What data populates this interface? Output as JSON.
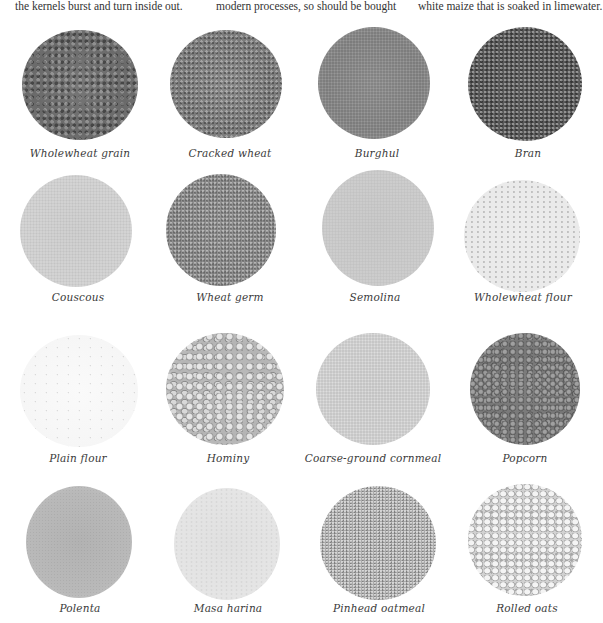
{
  "top_text": {
    "col1": "the kernels burst and turn inside out.",
    "col2": "modern processes, so should be bought",
    "col3": "white maize that is soaked in limewater."
  },
  "grains": [
    {
      "label": "Wholewheat grain",
      "texture": "coarse-dark"
    },
    {
      "label": "Cracked wheat",
      "texture": "coarse-mid"
    },
    {
      "label": "Burghul",
      "texture": "fine-mid"
    },
    {
      "label": "Bran",
      "texture": "bran"
    },
    {
      "label": "Couscous",
      "texture": "light-sand"
    },
    {
      "label": "Wheat germ",
      "texture": "wheatgerm"
    },
    {
      "label": "Semolina",
      "texture": "semolina"
    },
    {
      "label": "Wholewheat flour",
      "texture": "wwflour"
    },
    {
      "label": "Plain flour",
      "texture": "plainflour"
    },
    {
      "label": "Hominy",
      "texture": "hominy"
    },
    {
      "label": "Coarse-ground cornmeal",
      "texture": "cornmeal"
    },
    {
      "label": "Popcorn",
      "texture": "popcorn"
    },
    {
      "label": "Polenta",
      "texture": "polenta"
    },
    {
      "label": "Masa harina",
      "texture": "masa"
    },
    {
      "label": "Pinhead oatmeal",
      "texture": "pinhead"
    },
    {
      "label": "Rolled oats",
      "texture": "rolled"
    }
  ]
}
